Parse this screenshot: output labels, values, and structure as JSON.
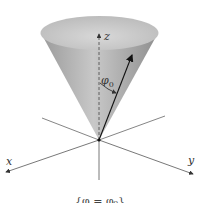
{
  "figure": {
    "axis_labels": {
      "x": "x",
      "y": "y",
      "z": "z"
    },
    "angle_label": "φ",
    "angle_subscript": "0",
    "caption": "{φ = φ₀}",
    "colors": {
      "cone_fill": "#b4b4b4",
      "cone_inner": "#cfcfcf",
      "axis": "#555555",
      "arrow": "#111111"
    }
  }
}
